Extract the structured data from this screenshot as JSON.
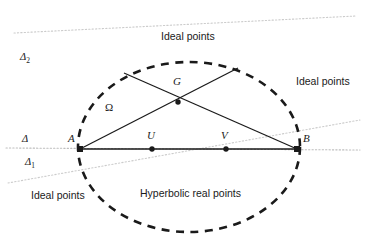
{
  "figure": {
    "width": 368,
    "height": 250,
    "background_color": "#ffffff",
    "stroke_color": "#1a1a1a",
    "dotted_color": "#bdbdbd"
  },
  "conic": {
    "name": "Omega",
    "label": "Ω",
    "label_x": 105,
    "label_y": 102,
    "style": "dashed",
    "center_x": 189,
    "center_y": 147,
    "rx": 111,
    "ry": 85
  },
  "points": [
    {
      "id": "A",
      "label": "A",
      "x": 80,
      "y": 149,
      "label_x": 68,
      "label_y": 133,
      "marker": "square"
    },
    {
      "id": "B",
      "label": "B",
      "x": 297,
      "y": 149,
      "label_x": 303,
      "label_y": 133,
      "marker": "square"
    },
    {
      "id": "U",
      "label": "U",
      "x": 152,
      "y": 149,
      "label_x": 147,
      "label_y": 130,
      "marker": "dot"
    },
    {
      "id": "V",
      "label": "V",
      "x": 226,
      "y": 149,
      "label_x": 221,
      "label_y": 130,
      "marker": "dot"
    },
    {
      "id": "G",
      "label": "G",
      "x": 178,
      "y": 102,
      "label_x": 173,
      "label_y": 76,
      "marker": "dot"
    }
  ],
  "chords": [
    {
      "name": "chord-A-to-upper-right",
      "x1": 80,
      "y1": 149,
      "x2": 238,
      "y2": 68
    },
    {
      "name": "chord-B-to-upper-left",
      "x1": 297,
      "y1": 149,
      "x2": 124,
      "y2": 73
    },
    {
      "name": "chord-A-to-B",
      "x1": 80,
      "y1": 149,
      "x2": 297,
      "y2": 149
    }
  ],
  "ideal_lines": [
    {
      "id": "delta",
      "label": "Δ",
      "subscript": "",
      "label_x": 22,
      "label_y": 134,
      "x1": 6,
      "y1": 148,
      "x2": 360,
      "y2": 150
    },
    {
      "id": "delta1",
      "label": "Δ",
      "subscript": "1",
      "label_x": 25,
      "label_y": 157,
      "x1": 8,
      "y1": 183,
      "x2": 360,
      "y2": 120
    },
    {
      "id": "delta2",
      "label": "Δ",
      "subscript": "2",
      "label_x": 20,
      "label_y": 52,
      "x1": 14,
      "y1": 33,
      "x2": 356,
      "y2": 16
    }
  ],
  "annotations": [
    {
      "id": "ideal-points-top",
      "text": "Ideal points",
      "x": 161,
      "y": 31
    },
    {
      "id": "ideal-points-right",
      "text": "Ideal points",
      "x": 296,
      "y": 76
    },
    {
      "id": "ideal-points-bottom",
      "text": "Ideal points",
      "x": 31,
      "y": 190
    },
    {
      "id": "hyperbolic-real",
      "text": "Hyperbolic real points",
      "x": 140,
      "y": 188
    }
  ]
}
